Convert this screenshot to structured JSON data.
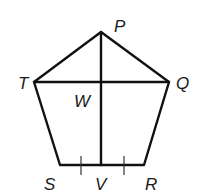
{
  "diagram": {
    "type": "pentagon-with-segments",
    "stroke_color": "#111111",
    "background": "#ffffff",
    "vertices": [
      {
        "name": "P",
        "label": "P",
        "x": 101,
        "y": 32
      },
      {
        "name": "Q",
        "label": "Q",
        "x": 169,
        "y": 82
      },
      {
        "name": "R",
        "label": "R",
        "x": 144,
        "y": 165
      },
      {
        "name": "S",
        "label": "S",
        "x": 60,
        "y": 165
      },
      {
        "name": "T",
        "label": "T",
        "x": 34,
        "y": 82
      }
    ],
    "points": [
      {
        "name": "W",
        "label": "W",
        "x": 101,
        "y": 82
      },
      {
        "name": "V",
        "label": "V",
        "x": 101,
        "y": 165
      }
    ],
    "segments": [
      "PQ",
      "QR",
      "RS",
      "ST",
      "TP",
      "TQ",
      "PV"
    ],
    "congruence_marks": [
      {
        "segment": "SV",
        "ticks": 1
      },
      {
        "segment": "VR",
        "ticks": 1
      }
    ]
  },
  "labels": {
    "P": "P",
    "Q": "Q",
    "R": "R",
    "S": "S",
    "T": "T",
    "V": "V",
    "W": "W"
  }
}
